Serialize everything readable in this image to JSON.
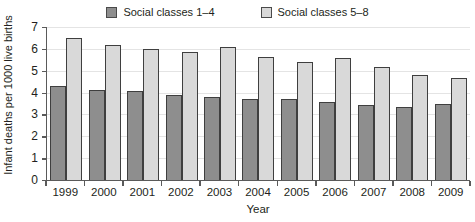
{
  "chart_data": {
    "type": "bar",
    "title": "",
    "xlabel": "Year",
    "ylabel": "Infant deaths per 1000 live births",
    "categories": [
      "1999",
      "2000",
      "2001",
      "2002",
      "2003",
      "2004",
      "2005",
      "2006",
      "2007",
      "2008",
      "2009"
    ],
    "series": [
      {
        "name": "Social classes 1–4",
        "color": "#8e8e8e",
        "values": [
          4.3,
          4.1,
          4.05,
          3.9,
          3.8,
          3.7,
          3.72,
          3.55,
          3.42,
          3.35,
          3.48
        ]
      },
      {
        "name": "Social classes 5–8",
        "color": "#d9d9d9",
        "values": [
          6.5,
          6.2,
          6.0,
          5.85,
          6.1,
          5.65,
          5.4,
          5.6,
          5.15,
          4.8,
          4.65
        ]
      }
    ],
    "ylim": [
      0,
      7
    ],
    "yticks": [
      "0",
      "1",
      "2",
      "3",
      "4",
      "5",
      "6",
      "7"
    ],
    "grid": true,
    "legend_position": "top"
  },
  "legend": {
    "items": [
      {
        "label": "Social classes 1–4",
        "swatch": "dark-swatch-icon"
      },
      {
        "label": "Social classes 5–8",
        "swatch": "light-swatch-icon"
      }
    ]
  },
  "axes": {
    "y_title": "Infant deaths per 1000 live births",
    "x_title": "Year"
  }
}
